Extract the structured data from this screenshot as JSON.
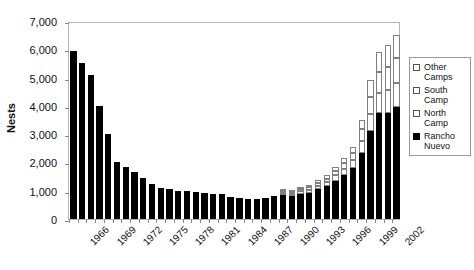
{
  "chart_data": {
    "type": "bar",
    "stacked": true,
    "title": "",
    "xlabel": "",
    "ylabel": "Nests",
    "ylim": [
      0,
      7000
    ],
    "ytick_step": 1000,
    "ytick_labels": [
      "0",
      "1,000",
      "2,000",
      "3,000",
      "4,000",
      "5,000",
      "6,000",
      "7,000"
    ],
    "ytick_values": [
      0,
      1000,
      2000,
      3000,
      4000,
      5000,
      6000,
      7000
    ],
    "grid": false,
    "legend_position": "right",
    "xtick_label_step": 3,
    "xtick_labels": [
      "1966",
      "1969",
      "1972",
      "1975",
      "1978",
      "1981",
      "1984",
      "1987",
      "1990",
      "1993",
      "1996",
      "1999",
      "2002"
    ],
    "categories": [
      "1966",
      "1967",
      "1968",
      "1969",
      "1970",
      "1971",
      "1972",
      "1973",
      "1974",
      "1975",
      "1976",
      "1977",
      "1978",
      "1979",
      "1980",
      "1981",
      "1982",
      "1983",
      "1984",
      "1985",
      "1986",
      "1987",
      "1988",
      "1989",
      "1990",
      "1991",
      "1992",
      "1993",
      "1994",
      "1995",
      "1996",
      "1997",
      "1998",
      "1999",
      "2000",
      "2001",
      "2002",
      "2003"
    ],
    "series": [
      {
        "name": "Rancho Nuevo",
        "color": "#000000",
        "values": [
          5950,
          5500,
          5100,
          4000,
          3000,
          2000,
          1850,
          1650,
          1450,
          1250,
          1100,
          1050,
          1000,
          980,
          950,
          930,
          900,
          880,
          790,
          760,
          700,
          710,
          730,
          810,
          860,
          800,
          890,
          920,
          1050,
          1150,
          1350,
          1550,
          1800,
          2350,
          3100,
          3750,
          3750,
          3950
        ]
      },
      {
        "name": "North Camp",
        "color": "#ffffff",
        "values": [
          0,
          0,
          0,
          0,
          0,
          0,
          0,
          0,
          0,
          0,
          0,
          0,
          0,
          0,
          0,
          0,
          0,
          0,
          0,
          0,
          0,
          0,
          0,
          0,
          60,
          70,
          90,
          110,
          130,
          150,
          190,
          230,
          280,
          420,
          600,
          720,
          800,
          850
        ]
      },
      {
        "name": "South Camp",
        "color": "#ffffff",
        "values": [
          0,
          0,
          0,
          0,
          0,
          0,
          0,
          0,
          0,
          0,
          0,
          0,
          0,
          0,
          0,
          0,
          0,
          0,
          0,
          0,
          0,
          0,
          0,
          0,
          50,
          60,
          70,
          90,
          110,
          130,
          160,
          200,
          250,
          400,
          620,
          740,
          820,
          880
        ]
      },
      {
        "name": "Other Camps",
        "color": "#ffffff",
        "values": [
          0,
          0,
          0,
          0,
          0,
          0,
          0,
          0,
          0,
          0,
          0,
          0,
          0,
          0,
          0,
          0,
          0,
          0,
          0,
          0,
          0,
          0,
          0,
          0,
          40,
          50,
          60,
          70,
          90,
          110,
          130,
          170,
          220,
          330,
          580,
          700,
          780,
          820
        ]
      }
    ]
  },
  "legend": {
    "items": [
      {
        "label": "Other Camps",
        "swatch": "open"
      },
      {
        "label": "South Camp",
        "swatch": "open"
      },
      {
        "label": "North Camp",
        "swatch": "open"
      },
      {
        "label": "Rancho Nuevo",
        "swatch": "filled"
      }
    ]
  }
}
